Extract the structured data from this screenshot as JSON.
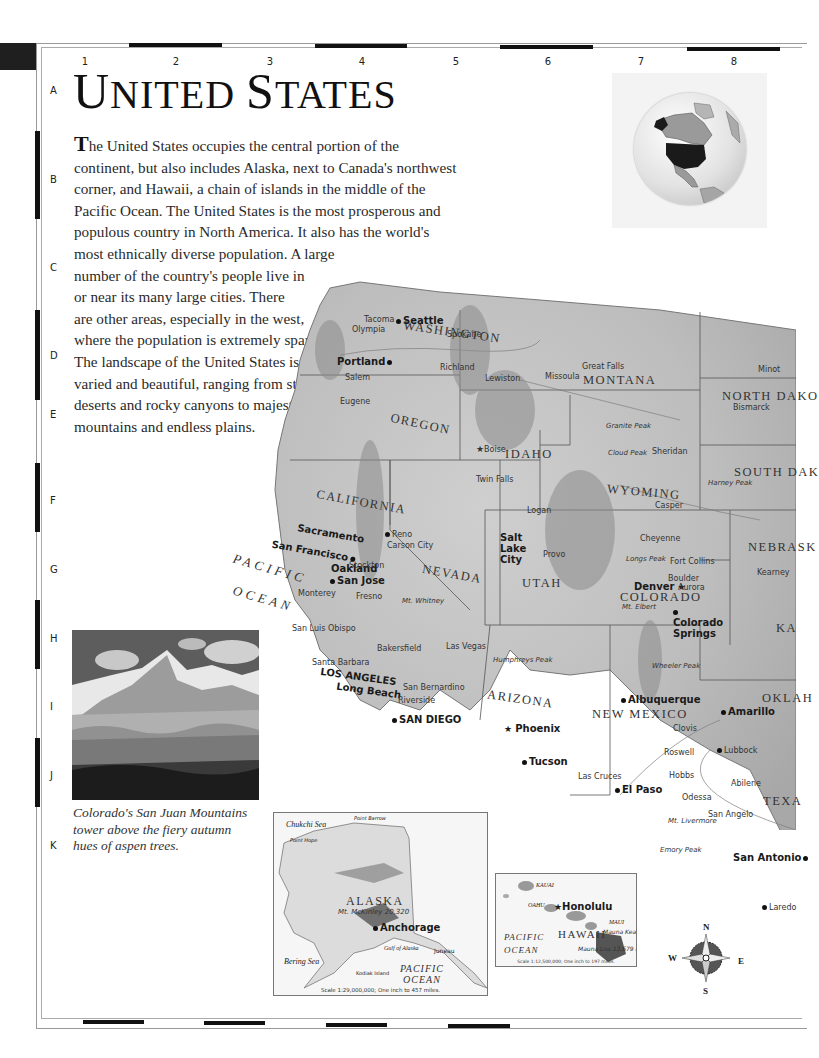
{
  "page": {
    "title": "United States",
    "title_display": [
      "U",
      "NITED ",
      "S",
      "TATES"
    ]
  },
  "grid": {
    "columns": [
      "1",
      "2",
      "3",
      "4",
      "5",
      "6",
      "7",
      "8"
    ],
    "rows": [
      "A",
      "B",
      "C",
      "D",
      "E",
      "F",
      "G",
      "H",
      "I",
      "J",
      "K"
    ]
  },
  "intro": {
    "drop_cap": "T",
    "lines": [
      "he United States occupies the central portion of the",
      "continent, but also includes Alaska, next to Canada's northwest",
      "corner, and Hawaii, a chain of islands in the middle of the",
      "Pacific Ocean. The United States is the most prosperous and",
      "populous country in North America. It also has the world's",
      "most ethnically diverse population. A large",
      "number of the country's people live in",
      "or near its many large cities. There",
      "are other areas, especially in the west,",
      "where the population is extremely sparse.",
      "The landscape of the United States is",
      "varied and beautiful, ranging from stark",
      "deserts and rocky canyons to majestic",
      "mountains and endless plains."
    ]
  },
  "locator_globe": {
    "highlight": "United States",
    "highlight_color": "#1a1a1a"
  },
  "photo": {
    "subject": "San Juan Mountains with aspen trees",
    "caption_lines": [
      "Colorado's San Juan Mountains",
      "tower above the fiery autumn",
      "hues of aspen trees."
    ]
  },
  "map": {
    "oceans": [
      {
        "name": "PACIFIC",
        "line2": "OCEAN"
      }
    ],
    "states": [
      "WASHINGTON",
      "OREGON",
      "CALIFORNIA",
      "IDAHO",
      "NEVADA",
      "MONTANA",
      "WYOMING",
      "UTAH",
      "COLORADO",
      "ARIZONA",
      "NEW MEXICO",
      "NORTH DAKO",
      "SOUTH DAK",
      "NEBRASK",
      "KA",
      "OKLAH",
      "TEXA"
    ],
    "major_cities": [
      "Seattle",
      "Portland",
      "Sacramento",
      "San Francisco",
      "Oakland",
      "San Jose",
      "LOS ANGELES",
      "Long Beach",
      "SAN DIEGO",
      "Salt Lake City",
      "Denver",
      "Colorado Springs",
      "Phoenix",
      "Albuquerque",
      "El Paso",
      "San Antonio",
      "Tucson",
      "Honolulu",
      "Anchorage"
    ],
    "cities": [
      "Bellingham",
      "Tacoma",
      "Olympia",
      "Spokane",
      "Richland",
      "Salem",
      "Eugene",
      "Medford",
      "Lewiston",
      "Missoula",
      "Helena",
      "Great Falls",
      "Boise",
      "Twin Falls",
      "Pocatello",
      "Reno",
      "Carson City",
      "Stockton",
      "Fresno",
      "Santa Rosa",
      "Santa Cruz",
      "Monterey",
      "San Luis Obispo",
      "Santa Barbara",
      "Bakersfield",
      "Lancaster",
      "San Bernardino",
      "Riverside",
      "Yuma",
      "Las Vegas",
      "Elko",
      "Logan",
      "Ogden",
      "Provo",
      "Grand Junction",
      "Fort Collins",
      "Boulder",
      "Aurora",
      "Cheyenne",
      "Casper",
      "Sheridan",
      "Rapid City",
      "Pierre",
      "Aberdeen",
      "Bismarck",
      "Minot",
      "Kearney",
      "Hutchinson",
      "Page",
      "Flagstaff",
      "Santa Fe",
      "Clovis",
      "Roswell",
      "Hobbs",
      "Las Cruces",
      "Amarillo",
      "Lubbock",
      "Lawton",
      "Abilene",
      "Big Spring",
      "Odessa",
      "San Angelo",
      "Laredo",
      "Kingsville",
      "Harlingen",
      "Brownsville",
      "Austin",
      "Juneau"
    ],
    "peaks": [
      {
        "name": "Mt. Olympus",
        "elev": "7,965 Ft."
      },
      {
        "name": "Mt. Rainier",
        "elev": "14,410 Ft."
      },
      {
        "name": "Mt. St. Helens",
        "elev": "8,364 Ft."
      },
      {
        "name": "Mt. Hood",
        "elev": "11,239 Ft."
      },
      {
        "name": "Mt. McLoughlin",
        "elev": "9,495 Ft."
      },
      {
        "name": "Mt. Shasta",
        "elev": "14,162 Ft."
      },
      {
        "name": "Borah Peak",
        "elev": "12,662 Ft."
      },
      {
        "name": "Granite Peak",
        "elev": "12,799 Ft."
      },
      {
        "name": "Cloud Peak",
        "elev": "13,167 Ft."
      },
      {
        "name": "Grand Teton",
        "elev": "13,770 Ft."
      },
      {
        "name": "Harney Peak",
        "elev": "7,242 Ft."
      },
      {
        "name": "Kings Peak",
        "elev": "13,528 Ft."
      },
      {
        "name": "Longs Peak",
        "elev": "14,255 Ft."
      },
      {
        "name": "Mt. Elbert",
        "elev": "14,433 Ft."
      },
      {
        "name": "Mt. Whitney",
        "elev": "14,494 Ft."
      },
      {
        "name": "Telescope Peak",
        "elev": "11,049 Ft."
      },
      {
        "name": "Humphreys Peak",
        "elev": "12,633 Ft."
      },
      {
        "name": "Baldy Peak",
        "elev": "11,403 Ft."
      },
      {
        "name": "Wheeler Peak",
        "elev": "13,161 Ft."
      },
      {
        "name": "Mt. Taylor",
        "elev": "11,301 Ft."
      },
      {
        "name": "Mt. Livermore",
        "elev": "8,379 Ft."
      },
      {
        "name": "Emory Peak",
        "elev": "7,825 Ft."
      },
      {
        "name": "Mt. McKinley",
        "elev": "20,320"
      },
      {
        "name": "Mauna Kea",
        "elev": "13,796 Ft."
      },
      {
        "name": "Mauna Loa",
        "elev": "13,679 Ft."
      }
    ],
    "ranges": [
      "BITTERROOT RANGE",
      "SALMON RIVER MOUNTAINS",
      "WASATCH RANGE",
      "GREAT BASIN",
      "SIERRA NEVADA",
      "COLORADO PLATEAU",
      "SACRAMENTO MTS.",
      "ROCKY MOUNTAINS",
      "BROOKS RANGE",
      "ALASKA RANGE",
      "ALASKA PENINSULA"
    ],
    "features": [
      "Cape Flattery",
      "Cape Blanco",
      "Cape Mendocino",
      "Point Arguello",
      "Columbia",
      "Snake",
      "Yellowstone",
      "Missouri",
      "Milk",
      "Fort Peck Lake",
      "Lake Oahe",
      "Lake Francis Case",
      "Great Salt Lake",
      "Lake Powell",
      "Flaming Gorge Res.",
      "American Falls Res.",
      "Goose Lake",
      "Platte",
      "North Platte",
      "Niobrara",
      "Smoky Hill",
      "Arkansas",
      "Canadian",
      "Red",
      "Brazos",
      "Colorado",
      "Pecos",
      "Rio Grande",
      "Gila",
      "Nueces",
      "Humboldt"
    ]
  },
  "alaska_inset": {
    "state": "ALASKA",
    "seas": [
      "Chukchi Sea",
      "Bering Sea",
      "Gulf of Alaska"
    ],
    "ocean": [
      "PACIFIC",
      "OCEAN"
    ],
    "places": [
      "Point Barrow",
      "Point Hope",
      "Anchorage",
      "Juneau",
      "Kodiak Island",
      "Yukon",
      "Kuskokwim"
    ],
    "peak": {
      "name": "Mt. McKinley",
      "elev": "20,320"
    },
    "ranges": [
      "BROOKS RANGE",
      "ALASKA RANGE",
      "ALASKA PENINSULA"
    ],
    "scale": "Scale 1:29,000,000; One inch to 457 miles."
  },
  "hawaii_inset": {
    "state": "HAWAII",
    "islands": [
      "KAUAI",
      "OAHU",
      "MAUI"
    ],
    "capital": "Honolulu",
    "ocean": [
      "PACIFIC",
      "OCEAN"
    ],
    "peaks": [
      {
        "name": "Mauna Kea",
        "elev": "13,796 Ft."
      },
      {
        "name": "Mauna Loa",
        "elev": "13,679 Ft."
      }
    ],
    "scale": "Scale 1:12,500,000; One inch to 197 miles."
  },
  "compass": {
    "n": "N",
    "s": "S",
    "e": "E",
    "w": "W"
  }
}
